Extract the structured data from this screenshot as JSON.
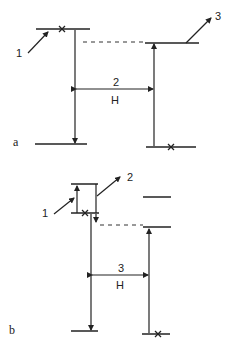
{
  "panel_a": {
    "panel_label": "a",
    "arrow_labels": {
      "pump": "1",
      "transition": "2",
      "emission": "3"
    },
    "transition_symbol": "H"
  },
  "panel_b": {
    "panel_label": "b",
    "arrow_labels": {
      "pump": "1",
      "emission": "2",
      "transition": "3"
    },
    "transition_symbol": "H"
  },
  "colors": {
    "line": "#222222",
    "background": "#ffffff"
  }
}
